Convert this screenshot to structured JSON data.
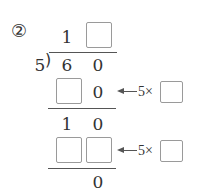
{
  "problem": {
    "number_label": "②",
    "divisor": "5",
    "dividend_digits": [
      "6",
      "0"
    ],
    "quotient": {
      "tens": "1",
      "ones_blank": ""
    },
    "step1": {
      "product_tens_blank": "",
      "product_ones": "0",
      "hint_label": "5×",
      "hint_blank": ""
    },
    "remainder1": {
      "tens": "1",
      "ones": "0"
    },
    "step2": {
      "product_tens_blank": "",
      "product_ones_blank": "",
      "hint_label": "5×",
      "hint_blank": ""
    },
    "final_remainder": "0"
  },
  "colors": {
    "text": "#333333",
    "box_border": "#9a9a9a",
    "line": "#555555"
  }
}
